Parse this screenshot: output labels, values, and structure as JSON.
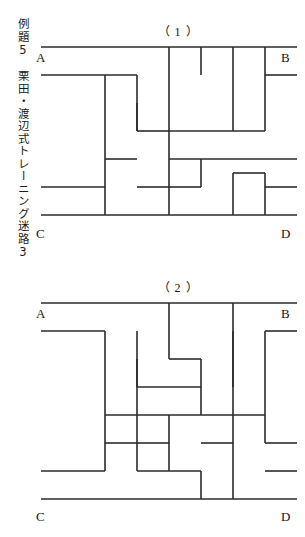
{
  "page": {
    "background_color": "#ffffff",
    "ink_color": "#2b2b2b",
    "width": 305,
    "height": 537
  },
  "caption": {
    "text": "例題5　栗田・渡辺式トレーニング迷路3",
    "orientation": "vertical",
    "lines": [
      "例題5",
      "栗田・渡辺式トレーニング迷路3"
    ]
  },
  "mazes": [
    {
      "id": "maze-1",
      "title": "（ 1 ）",
      "corners": {
        "top_left": "A",
        "top_right": "B",
        "bottom_left": "C",
        "bottom_right": "D"
      },
      "grid": {
        "cols": 8,
        "rows": 6,
        "cell_w": 32,
        "cell_h": 28
      },
      "walls": {
        "top_border": "0,0 256,0",
        "bottom_border": "0,168 256,168",
        "segments": [
          "0,28 96,28",
          "64,28 64,168",
          "96,28 96,84",
          "128,0 128,112",
          "160,0 160,28",
          "192,0 192,28",
          "192,28 192,84",
          "224,0 224,84",
          "128,84 224,84",
          "256,28 224,28",
          "96,56 96,84",
          "96,84 128,84",
          "64,112 96,112",
          "0,140 64,140",
          "96,140 128,140",
          "128,112 256,112",
          "128,112 128,168",
          "160,112 160,140",
          "128,140 160,140",
          "192,126 192,168",
          "192,126 224,126",
          "224,126 224,168",
          "256,140 224,140"
        ]
      }
    },
    {
      "id": "maze-2",
      "title": "（ 2 ）",
      "corners": {
        "top_left": "A",
        "top_right": "B",
        "bottom_left": "C",
        "bottom_right": "D"
      },
      "grid": {
        "cols": 8,
        "rows": 6,
        "cell_w": 32,
        "cell_h": 28
      },
      "walls": {
        "top_border": "0,0 256,0",
        "bottom_border": "0,196 256,196",
        "segments": [
          "0,28 64,28",
          "64,28 64,168",
          "96,28 96,84",
          "128,0 128,28",
          "128,28 128,56",
          "128,56 160,56",
          "160,56 160,112",
          "192,0 192,84",
          "224,28 224,112",
          "256,28 224,28",
          "96,56 96,168",
          "96,84 160,84",
          "64,112 160,112",
          "160,112 224,112",
          "224,112 224,140",
          "224,140 256,140",
          "64,140 96,140",
          "96,140 128,140",
          "128,112 128,168",
          "160,140 192,140",
          "0,168 64,168",
          "96,168 160,168",
          "160,168 160,196",
          "192,28 192,196",
          "224,168 256,168"
        ]
      }
    }
  ]
}
